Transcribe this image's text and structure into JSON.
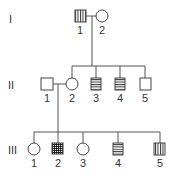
{
  "diagram": {
    "type": "pedigree",
    "generations": [
      {
        "label": "I",
        "individuals": [
          {
            "id": "1",
            "sex": "male",
            "pattern": "vertical-stripes"
          },
          {
            "id": "2",
            "sex": "female",
            "pattern": "none"
          }
        ]
      },
      {
        "label": "II",
        "individuals": [
          {
            "id": "1",
            "sex": "male",
            "pattern": "none"
          },
          {
            "id": "2",
            "sex": "female",
            "pattern": "none"
          },
          {
            "id": "3",
            "sex": "male",
            "pattern": "horizontal-stripes"
          },
          {
            "id": "4",
            "sex": "male",
            "pattern": "horizontal-stripes"
          },
          {
            "id": "5",
            "sex": "male",
            "pattern": "none"
          }
        ]
      },
      {
        "label": "III",
        "individuals": [
          {
            "id": "1",
            "sex": "female",
            "pattern": "none"
          },
          {
            "id": "2",
            "sex": "male",
            "pattern": "grid"
          },
          {
            "id": "3",
            "sex": "female",
            "pattern": "none"
          },
          {
            "id": "4",
            "sex": "male",
            "pattern": "horizontal-stripes"
          },
          {
            "id": "5",
            "sex": "male",
            "pattern": "vertical-stripes"
          }
        ]
      }
    ],
    "relationships": [
      {
        "couple": [
          "I-1",
          "I-2"
        ],
        "children": [
          "II-2",
          "II-3",
          "II-4",
          "II-5"
        ]
      },
      {
        "couple": [
          "II-1",
          "II-2"
        ],
        "children": [
          "III-1",
          "III-2",
          "III-3",
          "III-4",
          "III-5"
        ]
      }
    ],
    "colors": {
      "line": "#555555",
      "symbol_stroke": "#444444",
      "text": "#333333"
    }
  }
}
